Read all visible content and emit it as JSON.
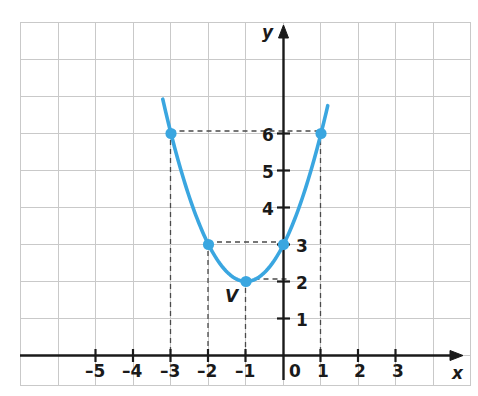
{
  "chart_data": {
    "type": "line",
    "title": "",
    "subtitle": "",
    "xlabel": "x",
    "ylabel": "y",
    "xlim": [
      -6.6,
      4.8
    ],
    "ylim": [
      -0.9,
      8.7
    ],
    "grid": true,
    "legend": null,
    "function": "y = x^2 + 2x + 3",
    "series": [
      {
        "name": "parabola",
        "color": "#3aa6e0",
        "x": [
          -3.2,
          -3.0,
          -2.5,
          -2.0,
          -1.5,
          -1.0,
          -0.5,
          0.0,
          0.5,
          1.0,
          1.2
        ],
        "values": [
          6.76,
          6.0,
          4.25,
          3.0,
          2.25,
          2.0,
          2.25,
          3.0,
          4.25,
          6.0,
          6.84
        ]
      }
    ],
    "points": [
      {
        "x": -3,
        "y": 6,
        "label": ""
      },
      {
        "x": -2,
        "y": 3,
        "label": ""
      },
      {
        "x": -1,
        "y": 2,
        "label": "V"
      },
      {
        "x": 0,
        "y": 3,
        "label": ""
      },
      {
        "x": 1,
        "y": 6,
        "label": ""
      }
    ],
    "xticks": [
      -5,
      -4,
      -3,
      -2,
      -1,
      0,
      1,
      2,
      3
    ],
    "xtick_labels": [
      "–5",
      "–4",
      "–3",
      "–2",
      "–1",
      "0",
      "1",
      "2",
      "3"
    ],
    "yticks": [
      1,
      2,
      3,
      4,
      5,
      6
    ],
    "ytick_labels": [
      "1",
      "2",
      "3",
      "4",
      "5",
      "6"
    ],
    "annotations": [
      {
        "name": "vertex-label",
        "text": "V",
        "x": -1,
        "y": 2
      }
    ],
    "guide_lines": [
      {
        "type": "horizontal",
        "y": 6,
        "from_x": -3,
        "to_x": 1
      },
      {
        "type": "horizontal",
        "y": 3,
        "from_x": -2,
        "to_x": 0
      },
      {
        "type": "horizontal",
        "y": 2,
        "from_x": -1,
        "to_x": 0
      },
      {
        "type": "vertical",
        "x": -3,
        "from_y": 0,
        "to_y": 6
      },
      {
        "type": "vertical",
        "x": -2,
        "from_y": 0,
        "to_y": 3
      },
      {
        "type": "vertical",
        "x": -1,
        "from_y": 0,
        "to_y": 2
      },
      {
        "type": "vertical",
        "x": 1,
        "from_y": 0,
        "to_y": 6
      }
    ],
    "colors": {
      "curve": "#3aa6e0",
      "point": "#3aa6e0",
      "axis": "#1a1a1a",
      "grid": "#c9c9c9",
      "dashed": "#4a4a4a",
      "background": "#ffffff"
    }
  }
}
